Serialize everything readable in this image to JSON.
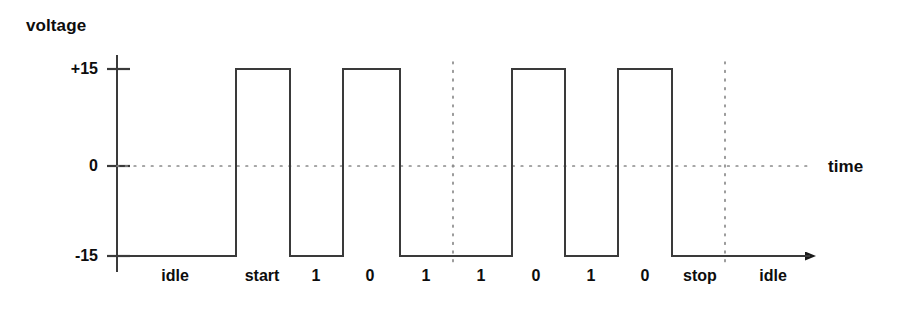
{
  "axes": {
    "y_title": "voltage",
    "x_title": "time",
    "y_ticks": [
      {
        "label": "+15",
        "value": 15,
        "y": 69
      },
      {
        "label": "0",
        "value": 0,
        "y": 166
      },
      {
        "label": "-15",
        "value": -15,
        "y": 256
      }
    ]
  },
  "bit_labels": [
    {
      "text": "idle",
      "x": 175
    },
    {
      "text": "start",
      "x": 262
    },
    {
      "text": "1",
      "x": 316
    },
    {
      "text": "0",
      "x": 370
    },
    {
      "text": "1",
      "x": 426
    },
    {
      "text": "1",
      "x": 481
    },
    {
      "text": "0",
      "x": 536
    },
    {
      "text": "1",
      "x": 591
    },
    {
      "text": "0",
      "x": 645
    },
    {
      "text": "stop",
      "x": 700
    },
    {
      "text": "idle",
      "x": 773
    }
  ],
  "colors": {
    "line": "#3a3a3a",
    "axis": "#3a3a3a",
    "dotted": "#8a8a8a",
    "text": "#0d0d0d",
    "background": "#ffffff"
  },
  "chart_data": {
    "type": "line",
    "title": "",
    "xlabel": "time",
    "ylabel": "voltage",
    "ylim": [
      -15,
      15
    ],
    "grid": false,
    "legend": null,
    "y_tick_labels": [
      "+15",
      "0",
      "-15"
    ],
    "y_tick_values": [
      15,
      0,
      -15
    ],
    "annotations": [
      "idle",
      "start",
      "1",
      "0",
      "1",
      "1",
      "0",
      "1",
      "0",
      "stop",
      "idle"
    ],
    "bit_sequence": [
      "1",
      "0",
      "1",
      "1",
      "0",
      "1",
      "0"
    ],
    "voltage_levels": {
      "mark": -15,
      "space": 15
    },
    "separators_x": [
      453,
      725
    ],
    "series": [
      {
        "name": "line voltage",
        "x": [
          117,
          236,
          236,
          290,
          290,
          343,
          343,
          400,
          400,
          512,
          512,
          565,
          565,
          618,
          618,
          672,
          672,
          810
        ],
        "values": [
          -15,
          -15,
          15,
          15,
          -15,
          -15,
          15,
          15,
          -15,
          -15,
          15,
          15,
          -15,
          -15,
          15,
          15,
          -15,
          -15
        ]
      }
    ],
    "segments": [
      {
        "label": "idle",
        "level": -15,
        "x_start": 117,
        "x_end": 236
      },
      {
        "label": "start",
        "level": 15,
        "x_start": 236,
        "x_end": 290
      },
      {
        "label": "1",
        "level": -15,
        "x_start": 290,
        "x_end": 343
      },
      {
        "label": "0",
        "level": 15,
        "x_start": 343,
        "x_end": 400
      },
      {
        "label": "1",
        "level": -15,
        "x_start": 400,
        "x_end": 453
      },
      {
        "label": "1",
        "level": -15,
        "x_start": 453,
        "x_end": 512
      },
      {
        "label": "0",
        "level": 15,
        "x_start": 512,
        "x_end": 565
      },
      {
        "label": "1",
        "level": -15,
        "x_start": 565,
        "x_end": 618
      },
      {
        "label": "0",
        "level": 15,
        "x_start": 618,
        "x_end": 672
      },
      {
        "label": "stop",
        "level": -15,
        "x_start": 672,
        "x_end": 725
      },
      {
        "label": "idle",
        "level": -15,
        "x_start": 725,
        "x_end": 810
      }
    ]
  }
}
